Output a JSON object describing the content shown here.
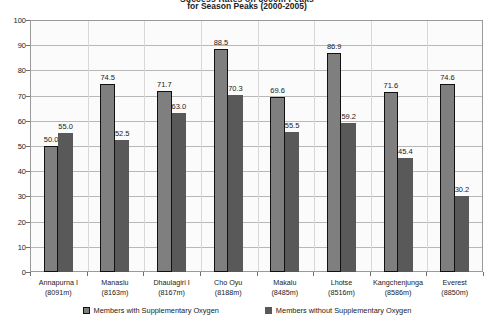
{
  "chart_data": {
    "type": "bar",
    "title": "Success Rates on 8000m Peaks",
    "subtitle": "for Season Peaks (2000-2005)",
    "xlabel": "",
    "ylabel": "",
    "ylim": [
      0,
      100
    ],
    "ytick_step": 10,
    "yticks": [
      "100",
      "90",
      "80",
      "70",
      "60",
      "50",
      "40",
      "30",
      "20",
      "10",
      "0"
    ],
    "grid": true,
    "legend_position": "bottom",
    "categories": [
      "Annapurna I",
      "Manaslu",
      "Dhaulagiri I",
      "Cho Oyu",
      "Makalu",
      "Lhotse",
      "Kangchenjunga",
      "Everest"
    ],
    "category_altitudes": [
      "(8091m)",
      "(8163m)",
      "(8167m)",
      "(8188m)",
      "(8485m)",
      "(8516m)",
      "(8586m)",
      "(8850m)"
    ],
    "series": [
      {
        "name": "Members with Supplementary Oxygen",
        "color": "#7f7f7f",
        "values": [
          50.0,
          74.5,
          71.7,
          88.5,
          69.6,
          86.9,
          71.6,
          74.6
        ],
        "labels": [
          "50.0",
          "74.5",
          "71.7",
          "88.5",
          "69.6",
          "86.9",
          "71.6",
          "74.6"
        ]
      },
      {
        "name": "Members without Supplementary Oxygen",
        "color": "#595959",
        "values": [
          55.0,
          52.5,
          63.0,
          70.3,
          55.5,
          59.2,
          45.4,
          30.2
        ],
        "labels": [
          "55.0",
          "52.5",
          "63.0",
          "70.3",
          "55.5",
          "59.2",
          "45.4",
          "30.2"
        ]
      }
    ]
  }
}
